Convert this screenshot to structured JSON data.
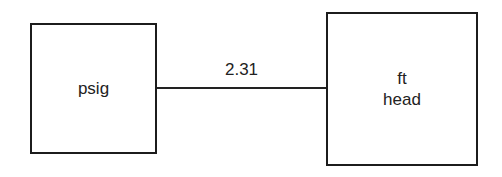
{
  "diagram": {
    "nodes": [
      {
        "id": "left",
        "lines": [
          "psig"
        ]
      },
      {
        "id": "right",
        "lines": [
          "ft",
          "head"
        ]
      }
    ],
    "edge": {
      "from": "left",
      "to": "right",
      "label": "2.31"
    },
    "colors": {
      "stroke": "#1c1c1c",
      "background": "#ffffff",
      "text": "#222222"
    }
  }
}
